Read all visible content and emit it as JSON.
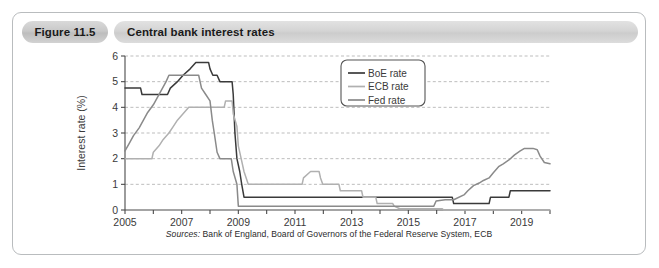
{
  "figure": {
    "number": "Figure 11.5",
    "title": "Central bank interest rates",
    "source_label": "Sources:",
    "source_text": " Bank of England, Board of Governors of the Federal Reserve System, ECB"
  },
  "colors": {
    "boe": "#3a3a3a",
    "ecb": "#b0b0b0",
    "fed": "#8a8a8a",
    "grid": "#b5b5b5",
    "axis": "#4a4a4a",
    "card_border": "#b9bcbe",
    "pill_gray": "#d4d4d4"
  },
  "chart_data": {
    "type": "line",
    "title": "Central bank interest rates",
    "xlabel": "",
    "ylabel": "Interest rate (%)",
    "xlim": [
      2005,
      2020
    ],
    "ylim": [
      0,
      6
    ],
    "yticks": [
      0,
      1,
      2,
      3,
      4,
      5,
      6
    ],
    "ytick_labels": [
      "0",
      "1",
      "2",
      "3",
      "4",
      "5",
      "6"
    ],
    "xticks": [
      2005,
      2006,
      2007,
      2008,
      2009,
      2010,
      2011,
      2012,
      2013,
      2014,
      2015,
      2016,
      2017,
      2018,
      2019,
      2020
    ],
    "xtick_labels": [
      "2005",
      "",
      "2007",
      "",
      "2009",
      "",
      "2011",
      "",
      "2013",
      "",
      "2015",
      "",
      "2017",
      "",
      "2019",
      ""
    ],
    "grid": true,
    "grid_axis": "y",
    "legend_position": "upper right",
    "series": [
      {
        "name": "BoE rate",
        "color": "#3a3a3a",
        "points": [
          [
            2005.0,
            4.75
          ],
          [
            2005.55,
            4.75
          ],
          [
            2005.6,
            4.5
          ],
          [
            2006.5,
            4.5
          ],
          [
            2006.6,
            4.75
          ],
          [
            2006.85,
            5.0
          ],
          [
            2007.05,
            5.25
          ],
          [
            2007.3,
            5.5
          ],
          [
            2007.5,
            5.75
          ],
          [
            2007.95,
            5.75
          ],
          [
            2008.0,
            5.5
          ],
          [
            2008.1,
            5.25
          ],
          [
            2008.25,
            5.25
          ],
          [
            2008.35,
            5.0
          ],
          [
            2008.78,
            5.0
          ],
          [
            2008.82,
            4.5
          ],
          [
            2008.88,
            3.0
          ],
          [
            2008.95,
            2.0
          ],
          [
            2009.05,
            1.5
          ],
          [
            2009.12,
            1.0
          ],
          [
            2009.2,
            0.5
          ],
          [
            2016.55,
            0.5
          ],
          [
            2016.6,
            0.25
          ],
          [
            2017.85,
            0.25
          ],
          [
            2017.9,
            0.5
          ],
          [
            2018.55,
            0.5
          ],
          [
            2018.6,
            0.75
          ],
          [
            2020.0,
            0.75
          ]
        ]
      },
      {
        "name": "ECB rate",
        "color": "#b0b0b0",
        "points": [
          [
            2005.0,
            2.0
          ],
          [
            2005.95,
            2.0
          ],
          [
            2006.0,
            2.25
          ],
          [
            2006.2,
            2.5
          ],
          [
            2006.35,
            2.75
          ],
          [
            2006.55,
            3.0
          ],
          [
            2006.7,
            3.25
          ],
          [
            2006.85,
            3.5
          ],
          [
            2007.05,
            3.75
          ],
          [
            2007.25,
            4.0
          ],
          [
            2008.5,
            4.0
          ],
          [
            2008.55,
            4.25
          ],
          [
            2008.78,
            4.25
          ],
          [
            2008.82,
            3.75
          ],
          [
            2008.95,
            3.25
          ],
          [
            2009.0,
            2.5
          ],
          [
            2009.1,
            2.0
          ],
          [
            2009.2,
            1.5
          ],
          [
            2009.35,
            1.0
          ],
          [
            2011.25,
            1.0
          ],
          [
            2011.3,
            1.25
          ],
          [
            2011.55,
            1.5
          ],
          [
            2011.85,
            1.5
          ],
          [
            2011.9,
            1.25
          ],
          [
            2011.98,
            1.0
          ],
          [
            2012.55,
            1.0
          ],
          [
            2012.6,
            0.75
          ],
          [
            2013.35,
            0.75
          ],
          [
            2013.4,
            0.5
          ],
          [
            2013.85,
            0.5
          ],
          [
            2013.9,
            0.25
          ],
          [
            2014.45,
            0.25
          ],
          [
            2014.5,
            0.15
          ],
          [
            2014.7,
            0.05
          ],
          [
            2016.2,
            0.05
          ],
          [
            2016.25,
            0.0
          ],
          [
            2020.0,
            0.0
          ]
        ]
      },
      {
        "name": "Fed rate",
        "color": "#8a8a8a",
        "points": [
          [
            2005.0,
            2.3
          ],
          [
            2005.15,
            2.6
          ],
          [
            2005.3,
            2.9
          ],
          [
            2005.5,
            3.2
          ],
          [
            2005.65,
            3.5
          ],
          [
            2005.8,
            3.8
          ],
          [
            2006.0,
            4.1
          ],
          [
            2006.15,
            4.4
          ],
          [
            2006.3,
            4.7
          ],
          [
            2006.45,
            5.0
          ],
          [
            2006.55,
            5.25
          ],
          [
            2007.6,
            5.25
          ],
          [
            2007.7,
            4.75
          ],
          [
            2007.85,
            4.5
          ],
          [
            2008.0,
            4.25
          ],
          [
            2008.08,
            3.5
          ],
          [
            2008.15,
            3.0
          ],
          [
            2008.25,
            2.25
          ],
          [
            2008.35,
            2.0
          ],
          [
            2008.75,
            2.0
          ],
          [
            2008.82,
            1.5
          ],
          [
            2008.95,
            1.0
          ],
          [
            2009.0,
            0.15
          ],
          [
            2015.9,
            0.15
          ],
          [
            2015.98,
            0.35
          ],
          [
            2016.3,
            0.4
          ],
          [
            2016.6,
            0.4
          ],
          [
            2016.98,
            0.6
          ],
          [
            2017.1,
            0.75
          ],
          [
            2017.3,
            0.95
          ],
          [
            2017.5,
            1.05
          ],
          [
            2017.65,
            1.15
          ],
          [
            2017.85,
            1.25
          ],
          [
            2018.0,
            1.45
          ],
          [
            2018.2,
            1.7
          ],
          [
            2018.35,
            1.8
          ],
          [
            2018.55,
            1.95
          ],
          [
            2018.75,
            2.15
          ],
          [
            2018.95,
            2.3
          ],
          [
            2019.1,
            2.4
          ],
          [
            2019.4,
            2.4
          ],
          [
            2019.55,
            2.35
          ],
          [
            2019.65,
            2.1
          ],
          [
            2019.8,
            1.85
          ],
          [
            2020.0,
            1.8
          ]
        ]
      }
    ],
    "legend": [
      {
        "label": "BoE rate",
        "color": "#3a3a3a"
      },
      {
        "label": "ECB rate",
        "color": "#b0b0b0"
      },
      {
        "label": "Fed rate",
        "color": "#8a8a8a"
      }
    ]
  }
}
